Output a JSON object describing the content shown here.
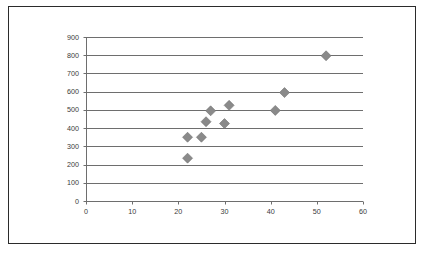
{
  "chart_data": {
    "type": "scatter",
    "title": "",
    "subtitle": "",
    "xlabel": "",
    "ylabel": "",
    "xlim": [
      0,
      60
    ],
    "ylim": [
      0,
      900
    ],
    "x_ticks": [
      0,
      10,
      20,
      30,
      40,
      50,
      60
    ],
    "y_ticks": [
      0,
      100,
      200,
      300,
      400,
      500,
      600,
      700,
      800,
      900
    ],
    "x_tick_labels": [
      "0",
      "10",
      "20",
      "30",
      "40",
      "50",
      "60"
    ],
    "y_tick_labels": [
      "0",
      "100",
      "200",
      "300",
      "400",
      "500",
      "600",
      "700",
      "800",
      "900"
    ],
    "grid": {
      "horizontal": true,
      "vertical": false
    },
    "legend": {
      "visible": false,
      "position": "none",
      "entries": []
    },
    "marker": {
      "shape": "diamond",
      "color": "#8a8a8a",
      "edge_color": "#6f6f6f",
      "size": 5
    },
    "series": [
      {
        "name": "Series 1",
        "points": [
          {
            "x": 22,
            "y": 235
          },
          {
            "x": 22,
            "y": 350
          },
          {
            "x": 25,
            "y": 350
          },
          {
            "x": 26,
            "y": 435
          },
          {
            "x": 27,
            "y": 495
          },
          {
            "x": 30,
            "y": 425
          },
          {
            "x": 31,
            "y": 525
          },
          {
            "x": 41,
            "y": 497
          },
          {
            "x": 43,
            "y": 595
          },
          {
            "x": 52,
            "y": 797
          }
        ]
      }
    ]
  },
  "colors": {
    "frame_border": "#2b2b2b",
    "axis": "#6e6e6e",
    "gridline": "#6e6e6e",
    "marker": "#8a8a8a",
    "tick_text": "#3a3a3a",
    "background": "#ffffff"
  }
}
